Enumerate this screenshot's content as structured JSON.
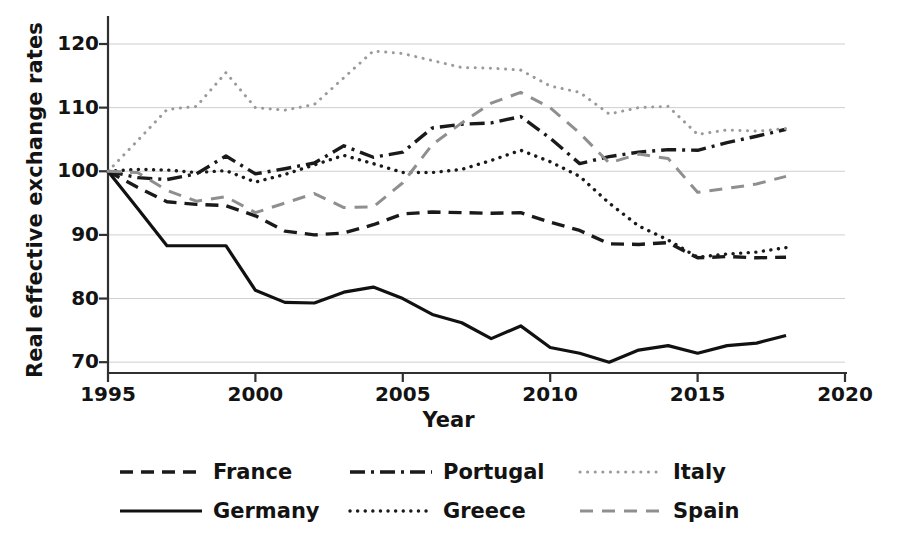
{
  "chart_data": {
    "type": "line",
    "title": "",
    "xlabel": "Year",
    "ylabel": "Real effective exchange rates",
    "xlim": [
      1995,
      2020
    ],
    "ylim": [
      65,
      123
    ],
    "xticks": [
      1995,
      2000,
      2005,
      2010,
      2015,
      2020
    ],
    "yticks": [
      70,
      80,
      90,
      100,
      110,
      120
    ],
    "grid": "horizontal",
    "legend_position": "below-plot",
    "x": [
      1995,
      1996,
      1997,
      1998,
      1999,
      2000,
      2001,
      2002,
      2003,
      2004,
      2005,
      2006,
      2007,
      2008,
      2009,
      2010,
      2011,
      2012,
      2013,
      2014,
      2015,
      2016,
      2017,
      2018
    ],
    "series": [
      {
        "name": "France",
        "style": "dashed",
        "color": "#1a1a1a",
        "values": [
          100,
          97.5,
          95.2,
          94.8,
          94.6,
          93.0,
          90.6,
          90.0,
          90.3,
          91.6,
          93.3,
          93.6,
          93.5,
          93.4,
          93.5,
          92.0,
          90.7,
          88.6,
          88.5,
          88.8,
          86.4,
          86.6,
          86.4,
          86.5
        ]
      },
      {
        "name": "Germany",
        "style": "solid",
        "color": "#111111",
        "values": [
          100,
          94.2,
          88.3,
          88.3,
          88.3,
          81.3,
          79.4,
          79.3,
          81.0,
          81.8,
          80.0,
          77.5,
          76.2,
          73.7,
          75.7,
          72.3,
          71.4,
          70.0,
          71.9,
          72.6,
          71.4,
          72.6,
          73.0,
          74.2
        ]
      },
      {
        "name": "Portugal",
        "style": "dashdot",
        "color": "#1a1a1a",
        "values": [
          100,
          99.0,
          98.7,
          99.6,
          102.4,
          99.6,
          100.4,
          101.3,
          104.0,
          102.2,
          103.0,
          106.8,
          107.4,
          107.6,
          108.6,
          105.2,
          101.2,
          102.3,
          103.0,
          103.4,
          103.3,
          104.5,
          105.5,
          106.6
        ]
      },
      {
        "name": "Greece",
        "style": "dotted",
        "color": "#1a1a1a",
        "values": [
          100,
          100.3,
          100.2,
          99.8,
          100.1,
          98.3,
          99.5,
          101.0,
          102.5,
          101.2,
          99.8,
          99.8,
          100.3,
          101.7,
          103.3,
          101.5,
          99.2,
          95.0,
          91.4,
          89.2,
          86.5,
          87.0,
          87.3,
          88.0
        ]
      },
      {
        "name": "Italy",
        "style": "dotted-light",
        "color": "#9a9a9a",
        "values": [
          100,
          104.8,
          109.7,
          110.2,
          115.5,
          110.0,
          109.6,
          110.5,
          114.7,
          118.9,
          118.5,
          117.4,
          116.3,
          116.2,
          115.9,
          113.4,
          112.4,
          109.0,
          110.0,
          110.2,
          105.8,
          106.5,
          106.3,
          106.7
        ]
      },
      {
        "name": "Spain",
        "style": "dashed-light",
        "color": "#8f8f8f",
        "values": [
          100,
          99.8,
          97.0,
          95.3,
          96.0,
          93.5,
          95.0,
          96.5,
          94.3,
          94.4,
          98.2,
          104.2,
          107.6,
          110.7,
          112.4,
          110.0,
          106.0,
          101.3,
          102.7,
          102.0,
          96.7,
          97.3,
          98.0,
          99.2
        ]
      }
    ]
  },
  "legend": {
    "items": [
      {
        "label": "France",
        "key": "dashed"
      },
      {
        "label": "Germany",
        "key": "solid"
      },
      {
        "label": "Portugal",
        "key": "dashdot"
      },
      {
        "label": "Greece",
        "key": "dotted"
      },
      {
        "label": "Italy",
        "key": "dotted-light"
      },
      {
        "label": "Spain",
        "key": "dashed-light"
      }
    ]
  }
}
